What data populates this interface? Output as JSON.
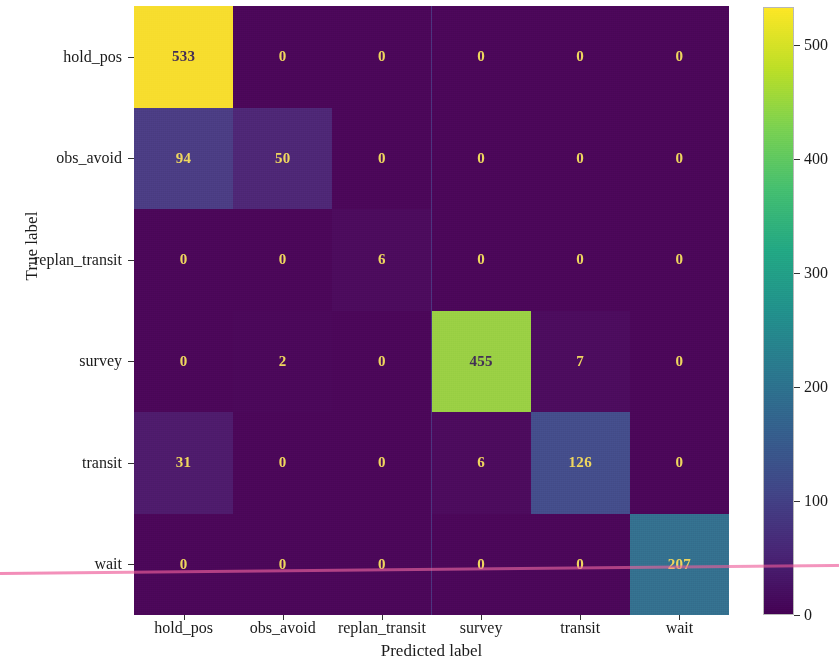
{
  "chart_data": {
    "type": "heatmap",
    "title": "",
    "xlabel": "Predicted label",
    "ylabel": "True label",
    "categories": [
      "hold_pos",
      "obs_avoid",
      "replan_transit",
      "survey",
      "transit",
      "wait"
    ],
    "x_tick_labels": [
      "hold_pos",
      "obs_avoid",
      "replan_transit",
      "survey",
      "transit",
      "wait"
    ],
    "y_tick_labels": [
      "hold_pos",
      "obs_avoid",
      "replan_transit",
      "survey",
      "transit",
      "wait"
    ],
    "matrix": [
      [
        533,
        0,
        0,
        0,
        0,
        0
      ],
      [
        94,
        50,
        0,
        0,
        0,
        0
      ],
      [
        0,
        0,
        6,
        0,
        0,
        0
      ],
      [
        0,
        2,
        0,
        455,
        7,
        0
      ],
      [
        31,
        0,
        0,
        6,
        126,
        0
      ],
      [
        0,
        0,
        0,
        0,
        0,
        207
      ]
    ],
    "row_labels": [
      "hold_pos",
      "obs_avoid",
      "replan_transit",
      "survey",
      "transit",
      "wait"
    ],
    "col_labels": [
      "hold_pos",
      "obs_avoid",
      "replan_transit",
      "survey",
      "transit",
      "wait"
    ],
    "colormap": "viridis",
    "vmin": 0,
    "vmax": 533,
    "grid": false,
    "legend_position": "right",
    "colorbar": {
      "orientation": "vertical",
      "ticks": [
        0,
        100,
        200,
        300,
        400,
        500
      ],
      "tick_labels": [
        "0",
        "100",
        "200",
        "300",
        "400",
        "500"
      ],
      "range": [
        0,
        533
      ]
    },
    "annotations": {
      "text_color_low": "#f5e05a",
      "text_color_high": "#3b2a50"
    },
    "colors": {
      "background_low": "#6d3f8a",
      "accent_high": "#fde725",
      "artifact_line": "#ec5696"
    }
  }
}
